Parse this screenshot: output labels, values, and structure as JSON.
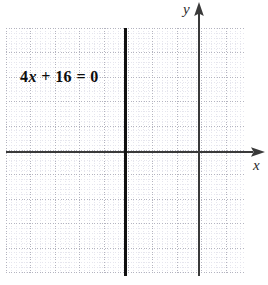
{
  "figure": {
    "kind": "coordinate-plane-graph",
    "background_color": "#ffffff",
    "equation": {
      "full_text": "4x + 16 = 0",
      "coefficient": "4",
      "variable": "x",
      "operator": "+",
      "constant": "16",
      "equals": "=",
      "right_side": "0"
    },
    "axes": {
      "x_label": "x",
      "y_label": "y",
      "axis_color": "#3a3a3a",
      "x_axis_y_px": 152,
      "y_axis_x_px": 199,
      "x_arrow": "right",
      "y_arrow": "up"
    },
    "grid": {
      "visible": true,
      "style": "dotted",
      "minor_color": "#e6e6ee",
      "major_color": "#b4b4c0",
      "minor_spacing_px": 4.88,
      "major_spacing_px": 24.4,
      "left_px": 6,
      "top_px": 28,
      "width_px": 238,
      "height_px": 245
    },
    "plotted_line": {
      "type": "vertical",
      "equation_solved": "x = -4",
      "color": "#111111",
      "thickness_px": 2.6,
      "x_position_px": 125
    }
  },
  "chart_data": {
    "type": "line",
    "title": "",
    "xlabel": "x",
    "ylabel": "y",
    "xlim": [
      -8,
      2
    ],
    "ylim": [
      -5,
      5
    ],
    "grid": true,
    "legend": null,
    "annotations": [
      {
        "text": "4x + 16 = 0",
        "x": -6.5,
        "y": 3.0
      }
    ],
    "series": [
      {
        "name": "4x + 16 = 0",
        "kind": "vertical-line",
        "x": -4,
        "points": [
          {
            "x": -4,
            "y": -5
          },
          {
            "x": -4,
            "y": 5
          }
        ]
      }
    ]
  }
}
